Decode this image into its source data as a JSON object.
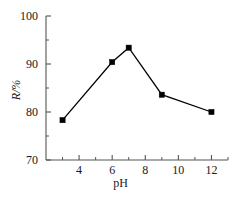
{
  "chart_data": {
    "type": "line",
    "title": "",
    "xlabel": "pH",
    "ylabel": "R/%",
    "ylabel_parts": {
      "symbol": "R",
      "separator": "/",
      "unit": "%"
    },
    "x": [
      3,
      6,
      7,
      9,
      12
    ],
    "values": [
      78.3,
      90.4,
      93.4,
      83.6,
      80.0
    ],
    "series": [
      {
        "name": "R",
        "x": [
          3,
          6,
          7,
          9,
          12
        ],
        "values": [
          78.3,
          90.4,
          93.4,
          83.6,
          80.0
        ],
        "marker": "square",
        "color": "#000000"
      }
    ],
    "xlim": [
      2,
      13
    ],
    "ylim": [
      70,
      100
    ],
    "xticks": [
      4,
      6,
      8,
      10,
      12
    ],
    "xtick_labels": [
      "4",
      "6",
      "8",
      "10",
      "12"
    ],
    "x_minor_ticks": [
      3,
      5,
      7,
      9,
      11,
      13
    ],
    "yticks": [
      70,
      80,
      90,
      100
    ],
    "ytick_labels": [
      "70",
      "80",
      "90",
      "100"
    ],
    "y_minor_ticks": [
      75,
      85,
      95
    ],
    "grid": false,
    "legend": false,
    "legend_position": "none",
    "line_color": "#000000",
    "marker_color": "#000000",
    "axis_color": "#555555"
  },
  "figure": {
    "background": "#ffffff"
  }
}
